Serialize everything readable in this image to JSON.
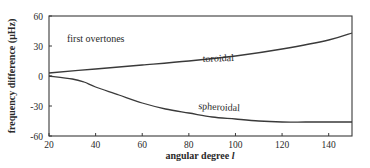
{
  "chart_data": {
    "type": "line",
    "title": "",
    "annotation": "first overtones",
    "xlabel": "angular degree l",
    "xlabel_text": "angular degree ",
    "xlabel_var": "l",
    "ylabel": "frequency difference (μHz)",
    "xlim": [
      20,
      150
    ],
    "ylim": [
      -60,
      60
    ],
    "xticks": [
      20,
      40,
      60,
      80,
      100,
      120,
      140
    ],
    "yticks": [
      60,
      30,
      0,
      -30,
      -60
    ],
    "ytick_labels": [
      "60",
      "30",
      "0",
      "-30",
      "-60"
    ],
    "xtick_labels": [
      "20",
      "40",
      "60",
      "80",
      "100",
      "120",
      "140"
    ],
    "grid": false,
    "legend": "none (curves labeled inline)",
    "series": [
      {
        "name": "toroidal",
        "x": [
          20,
          40,
          60,
          80,
          100,
          120,
          140,
          150
        ],
        "y": [
          3,
          7,
          11,
          15,
          20,
          27,
          36,
          43
        ],
        "label_position": {
          "x": 86,
          "y": 14
        }
      },
      {
        "name": "spheroidal",
        "x": [
          20,
          30,
          35,
          40,
          50,
          60,
          70,
          80,
          90,
          100,
          110,
          120,
          130,
          140,
          150
        ],
        "y": [
          0,
          -3,
          -6,
          -11,
          -19,
          -27,
          -33,
          -37,
          -41,
          -43,
          -45,
          -46,
          -46,
          -46,
          -46
        ],
        "label_position": {
          "x": 84,
          "y": -33
        }
      }
    ]
  }
}
